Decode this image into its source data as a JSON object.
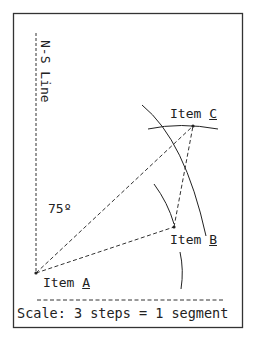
{
  "diagram": {
    "ns_line_label": "N-S Line",
    "angle_label": "75º",
    "items": [
      {
        "prefix": "Item ",
        "letter": "A"
      },
      {
        "prefix": "Item ",
        "letter": "B"
      },
      {
        "prefix": "Item ",
        "letter": "C"
      }
    ],
    "scale_label": "Scale: 3 steps = 1 segment"
  }
}
